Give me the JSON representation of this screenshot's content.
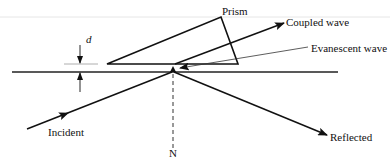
{
  "diagram": {
    "title": "",
    "labels": {
      "prism": "Prism",
      "coupled_wave": "Coupled wave",
      "evanescent_wave": "Evanescent wave",
      "gap": "d",
      "incident": "Incident",
      "reflected": "Reflected",
      "normal": "N"
    },
    "colors": {
      "stroke": "#111111",
      "thin_stroke": "#555555",
      "guide": "#bbbbbb",
      "background": "#ffffff"
    }
  }
}
